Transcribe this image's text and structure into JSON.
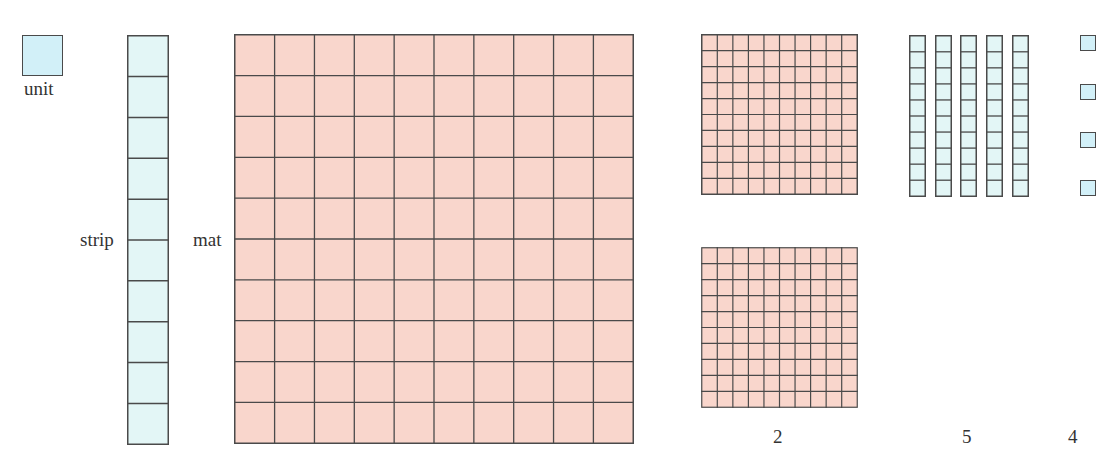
{
  "labels": {
    "unit": "unit",
    "strip": "strip",
    "mat": "mat",
    "mats_count": "2",
    "strips_count": "5",
    "units_count": "4"
  },
  "colors": {
    "unit_fill": "#d2f0f8",
    "strip_fill": "#e3f6f6",
    "mat_fill": "#f9d6cc",
    "line": "#4a4a4a"
  },
  "pieces": {
    "unit": {
      "cells": 1
    },
    "strip": {
      "cells": 10
    },
    "mat": {
      "cells": 100,
      "rows": 10,
      "cols": 10
    }
  },
  "counts": {
    "mats": 2,
    "strips": 5,
    "units": 4
  }
}
